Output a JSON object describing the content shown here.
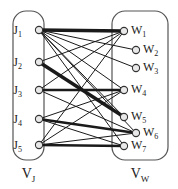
{
  "figure": {
    "type": "bipartite-graph-diagram",
    "background_color": "#ffffff",
    "line_color": "#1a1a1a",
    "node_fill": "#e8e8e8",
    "node_stroke": "#333333",
    "container_stroke": "#555555"
  },
  "groups": {
    "left": {
      "id": "VJ",
      "label_main": "V",
      "label_sub": "J",
      "box": {
        "x": 13,
        "y": 11,
        "w": 31,
        "h": 149,
        "r": 13
      }
    },
    "right": {
      "id": "VW",
      "label_main": "V",
      "label_sub": "W",
      "box": {
        "x": 112,
        "y": 11,
        "w": 56,
        "h": 149,
        "r": 13
      }
    }
  },
  "nodes": {
    "left": [
      {
        "id": "J1",
        "label_main": "J",
        "label_sub": "1",
        "cx": 39,
        "cy": 30,
        "label_x": 22,
        "label_y": 34
      },
      {
        "id": "J2",
        "label_main": "J",
        "label_sub": "2",
        "cx": 39,
        "cy": 62,
        "label_x": 22,
        "label_y": 66
      },
      {
        "id": "J3",
        "label_main": "J",
        "label_sub": "3",
        "cx": 39,
        "cy": 90,
        "label_x": 22,
        "label_y": 94
      },
      {
        "id": "J4",
        "label_main": "J",
        "label_sub": "4",
        "cx": 39,
        "cy": 119,
        "label_x": 22,
        "label_y": 123
      },
      {
        "id": "J5",
        "label_main": "J",
        "label_sub": "5",
        "cx": 39,
        "cy": 145,
        "label_x": 22,
        "label_y": 149
      }
    ],
    "right": [
      {
        "id": "W1",
        "label_main": "W",
        "label_sub": "1",
        "cx": 124,
        "cy": 31,
        "label_x": 131,
        "label_y": 34
      },
      {
        "id": "W2",
        "label_main": "W",
        "label_sub": "2",
        "cx": 136,
        "cy": 50,
        "label_x": 143,
        "label_y": 53
      },
      {
        "id": "W3",
        "label_main": "W",
        "label_sub": "3",
        "cx": 136,
        "cy": 68,
        "label_x": 143,
        "label_y": 71
      },
      {
        "id": "W4",
        "label_main": "W",
        "label_sub": "4",
        "cx": 124,
        "cy": 90,
        "label_x": 131,
        "label_y": 93
      },
      {
        "id": "W5",
        "label_main": "W",
        "label_sub": "5",
        "cx": 124,
        "cy": 117,
        "label_x": 131,
        "label_y": 120
      },
      {
        "id": "W6",
        "label_main": "W",
        "label_sub": "6",
        "cx": 136,
        "cy": 133,
        "label_x": 143,
        "label_y": 136
      },
      {
        "id": "W7",
        "label_main": "W",
        "label_sub": "7",
        "cx": 124,
        "cy": 146,
        "label_x": 131,
        "label_y": 149
      }
    ]
  },
  "node_radius": 3.6,
  "edges": [
    {
      "from": "J1",
      "to": "W1",
      "weight": 3.4
    },
    {
      "from": "J1",
      "to": "W2",
      "weight": 1.0
    },
    {
      "from": "J1",
      "to": "W3",
      "weight": 1.0
    },
    {
      "from": "J1",
      "to": "W4",
      "weight": 1.0
    },
    {
      "from": "J1",
      "to": "W5",
      "weight": 1.0
    },
    {
      "from": "J1",
      "to": "W6",
      "weight": 1.0
    },
    {
      "from": "J1",
      "to": "W7",
      "weight": 1.0
    },
    {
      "from": "J2",
      "to": "W1",
      "weight": 1.0
    },
    {
      "from": "J2",
      "to": "W5",
      "weight": 3.4
    },
    {
      "from": "J3",
      "to": "W4",
      "weight": 2.6
    },
    {
      "from": "J3",
      "to": "W6",
      "weight": 1.0
    },
    {
      "from": "J3",
      "to": "W1",
      "weight": 1.0
    },
    {
      "from": "J4",
      "to": "W4",
      "weight": 1.0
    },
    {
      "from": "J4",
      "to": "W6",
      "weight": 2.6
    },
    {
      "from": "J4",
      "to": "W7",
      "weight": 1.0
    },
    {
      "from": "J5",
      "to": "W7",
      "weight": 2.6
    },
    {
      "from": "J5",
      "to": "W6",
      "weight": 1.0
    },
    {
      "from": "J5",
      "to": "W4",
      "weight": 1.0
    },
    {
      "from": "J5",
      "to": "W1",
      "weight": 1.0
    }
  ]
}
